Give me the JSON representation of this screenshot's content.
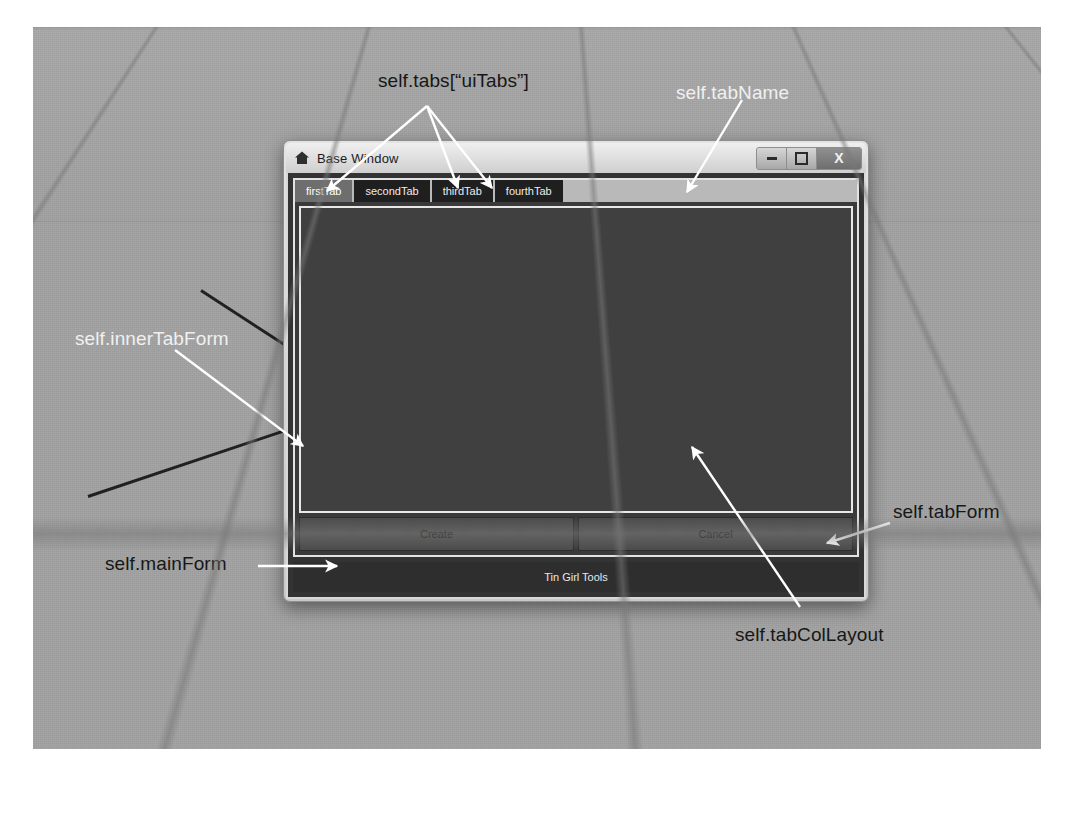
{
  "scene": {
    "description": "3D viewport with perspective grid floor and horizon",
    "background_color": "#a3a3a3",
    "grid_color": "#787878",
    "axis_line_color": "#1d1d1d"
  },
  "window": {
    "title": "Base Window",
    "icon": "home-icon",
    "controls": {
      "minimize_label": "—",
      "maximize_label": "□",
      "close_label": "X"
    }
  },
  "tabs": {
    "items": [
      {
        "label": "firstTab",
        "active": true
      },
      {
        "label": "secondTab",
        "active": false
      },
      {
        "label": "thirdTab",
        "active": false
      },
      {
        "label": "fourthTab",
        "active": false
      }
    ]
  },
  "buttons": {
    "create_label": "Create",
    "cancel_label": "Cancel"
  },
  "statusbar": {
    "text": "Tin Girl Tools"
  },
  "annotations": [
    {
      "id": "uiTabs",
      "text": "self.tabs[“uiTabs”]",
      "style": "dark",
      "x": 378,
      "y": 70
    },
    {
      "id": "tabName",
      "text": "self.tabName",
      "style": "light",
      "x": 676,
      "y": 82
    },
    {
      "id": "innerTabForm",
      "text": "self.innerTabForm",
      "style": "light",
      "x": 75,
      "y": 328
    },
    {
      "id": "mainForm",
      "text": "self.mainForm",
      "style": "dark",
      "x": 105,
      "y": 553
    },
    {
      "id": "tabForm",
      "text": "self.tabForm",
      "style": "dark",
      "x": 893,
      "y": 501
    },
    {
      "id": "tabColLayout",
      "text": "self.tabColLayout",
      "style": "dark",
      "x": 735,
      "y": 624
    }
  ],
  "colors": {
    "dialog_body": "#333333",
    "dialog_frame": "#d8d8d8",
    "panel": "#404040",
    "tab_inactive": "#1f1f1f",
    "tab_active": "#6e6e6e",
    "statusbar": "#2e2e2e"
  }
}
